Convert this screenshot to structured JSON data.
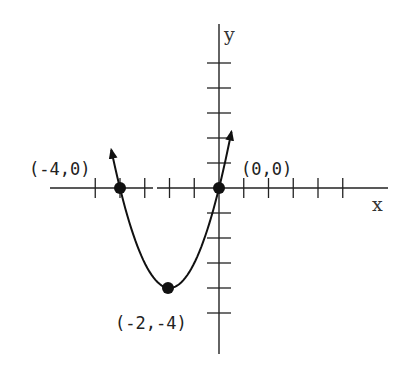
{
  "chart_data": {
    "type": "line",
    "title": "",
    "function": "y = x^2 + 4x",
    "xlabel": "x",
    "ylabel": "y",
    "xlim": [
      -6.8,
      6.8
    ],
    "ylim": [
      -6.6,
      6.6
    ],
    "grid": false,
    "legend": null,
    "x_ticks": [
      -5,
      -4,
      -3,
      -2,
      -1,
      1,
      2,
      3,
      4,
      5
    ],
    "y_ticks": [
      -5,
      -4,
      -3,
      -2,
      -1,
      1,
      2,
      3,
      4,
      5
    ],
    "series": [
      {
        "name": "parabola",
        "x": [
          -4.35,
          -4,
          -3.5,
          -3,
          -2.5,
          -2,
          -1.5,
          -1,
          -0.5,
          0,
          0.35,
          0.5
        ],
        "y": [
          1.52,
          0,
          -1.75,
          -3,
          -3.75,
          -4,
          -3.75,
          -3,
          -1.75,
          0,
          1.52,
          2.25
        ],
        "arrows_at_ends": true
      }
    ],
    "labeled_points": [
      {
        "x": -4,
        "y": 0,
        "label": "(-4,0)",
        "role": "x-intercept"
      },
      {
        "x": 0,
        "y": 0,
        "label": "(0,0)",
        "role": "x-intercept"
      },
      {
        "x": -2,
        "y": -4,
        "label": "(-2,-4)",
        "role": "vertex"
      }
    ],
    "colors": {
      "ink": "#111111",
      "background": "#ffffff"
    }
  },
  "labels": {
    "x_axis": "x",
    "y_axis": "y",
    "point_left": "(-4,0)",
    "point_origin": "(0,0)",
    "point_vertex": "(-2,-4)"
  }
}
